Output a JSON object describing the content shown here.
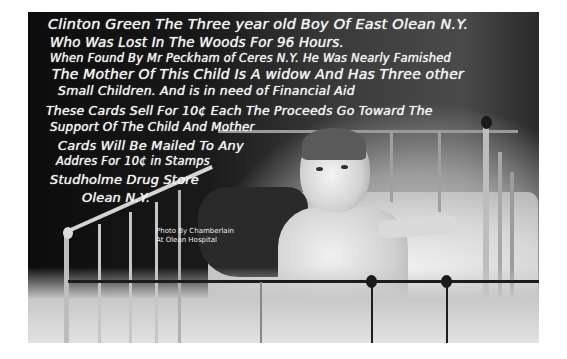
{
  "photo": {
    "subject": "Three-year-old boy sitting in an iron hospital crib",
    "style": "black-and-white vintage photo postcard",
    "caption_lines": [
      "Clinton Green The Three year old Boy Of East Olean N.Y.",
      "Who Was Lost In The Woods For 96 Hours.",
      "When Found By Mr Peckham of Ceres N.Y. He Was Nearly Famished",
      "The Mother Of This Child Is A widow And Has Three other",
      "Small Children. And is in need of Financial Aid",
      "These Cards Sell For 10¢ Each The Proceeds Go Toward The",
      "Support Of The Child And Mother",
      "Cards Will Be Mailed To Any",
      "Addres For 10¢ in Stamps",
      "Studholme Drug Store",
      "Olean N.Y."
    ],
    "credit_lines": [
      "Photo By Chamberlain",
      "At Olean Hospital"
    ]
  }
}
